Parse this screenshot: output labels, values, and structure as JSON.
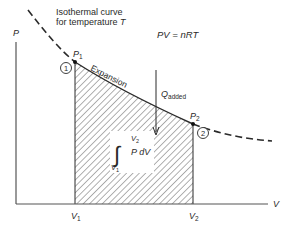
{
  "diagram": {
    "title_line1": "Isothermal curve",
    "title_line2": "for temperature",
    "title_var": "T",
    "equation": "PV = nRT",
    "axes": {
      "y_label": "P",
      "x_label": "V"
    },
    "points": [
      {
        "id": "1",
        "label": "P",
        "sub": "1",
        "circle": "1",
        "v_label": "V",
        "v_sub": "1"
      },
      {
        "id": "2",
        "label": "P",
        "sub": "2",
        "circle": "2",
        "v_label": "V",
        "v_sub": "2"
      }
    ],
    "curve_label": "Expansion",
    "heat_label": "Q",
    "heat_sub": "added",
    "integral": {
      "upper": "V",
      "upper_sub": "2",
      "lower": "V",
      "lower_sub": "1",
      "integrand": "P dV",
      "symbol": "∫"
    },
    "colors": {
      "line": "#2a2a2a",
      "axis": "#555555",
      "hatch": "#3a3a3a"
    }
  }
}
